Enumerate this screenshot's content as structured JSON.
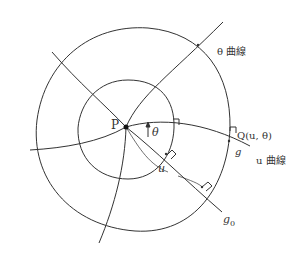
{
  "figure": {
    "colors": {
      "stroke": "#333333",
      "background": "#ffffff"
    },
    "labels": {
      "point_p": "P",
      "angle": "θ",
      "theta_curve": "θ 曲線",
      "point_q": "Q(u, θ)",
      "geodesic_g": "g",
      "u_curve": "u 曲線",
      "arc_length": "u",
      "geodesic_g0_base": "g",
      "geodesic_g0_sub": "0"
    },
    "elements": {
      "center_point": "P",
      "closed_curves": [
        "inner geodesic circle",
        "outer geodesic circle"
      ],
      "radial_curves": [
        "g",
        "g0",
        "θ curve direction",
        "left-down curve",
        "upper-left curve",
        "bottom curve"
      ],
      "right_angle_marks": 4
    }
  }
}
